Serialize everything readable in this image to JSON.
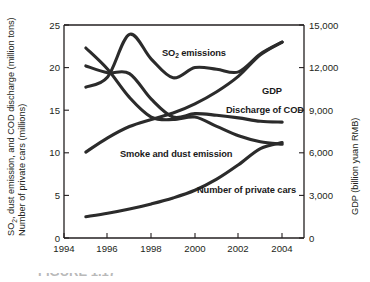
{
  "figure": {
    "caption_partial": "FIGURE 1.17"
  },
  "chart_data": {
    "type": "line",
    "title": "",
    "xlabel": "",
    "ylabel": "SO2, dust emission, and COD discharge (million tons) Number of private cars (millions)",
    "ylabel_line1": "SO",
    "ylabel_line1_sub": "2",
    "ylabel_line1_rest": ", dust emission, and COD discharge (million tons)",
    "ylabel_line2": "Number of private cars (millions)",
    "y2label": "GDP (billion yuan RMB)",
    "xlim": [
      1994,
      2005
    ],
    "ylim": [
      0,
      25
    ],
    "y2lim": [
      0,
      15000
    ],
    "grid": false,
    "legend_position": "inline-annotations",
    "xticks": [
      1994,
      1996,
      1998,
      2000,
      2002,
      2004
    ],
    "xtick_labels": [
      "1994",
      "1996",
      "1998",
      "2000",
      "2002",
      "2004"
    ],
    "yticks": [
      0,
      5,
      10,
      15,
      20,
      25
    ],
    "ytick_labels": [
      "0",
      "5",
      "10",
      "15",
      "20",
      "25"
    ],
    "y2ticks": [
      0,
      3000,
      6000,
      9000,
      12000,
      15000
    ],
    "y2tick_labels": [
      "0",
      "3,000",
      "6,000",
      "9,000",
      "12,000",
      "15,000"
    ],
    "x": [
      1995,
      1996,
      1997,
      1998,
      1999,
      2000,
      2001,
      2002,
      2003,
      2004
    ],
    "series": [
      {
        "name": "SO2 emissions",
        "label": "SO2 emissions",
        "label_main": "SO",
        "label_sub": "2",
        "label_rest": " emissions",
        "axis": "left",
        "units": "million tons",
        "values": [
          17.7,
          18.9,
          23.9,
          21.0,
          18.8,
          20.0,
          19.8,
          19.5,
          21.6,
          23.0
        ]
      },
      {
        "name": "Smoke and dust emission",
        "label": "Smoke and dust emission",
        "axis": "left",
        "units": "million tons",
        "values": [
          22.3,
          19.8,
          16.5,
          14.2,
          13.9,
          14.2,
          13.1,
          12.0,
          11.3,
          11.0
        ]
      },
      {
        "name": "Discharge of COD",
        "label": "Discharge of COD",
        "axis": "left",
        "units": "million tons",
        "values": [
          20.2,
          19.4,
          19.3,
          16.3,
          14.2,
          14.6,
          14.4,
          14.1,
          13.7,
          13.6
        ]
      },
      {
        "name": "Number of private cars",
        "label": "Number of private cars",
        "axis": "left",
        "units": "millions",
        "values": [
          2.5,
          2.9,
          3.4,
          4.0,
          4.7,
          5.6,
          6.9,
          8.6,
          10.5,
          11.2
        ]
      },
      {
        "name": "GDP",
        "label": "GDP",
        "axis": "right",
        "units": "billion yuan RMB",
        "values": [
          6050,
          7050,
          7850,
          8350,
          8800,
          9450,
          10300,
          11400,
          12900,
          13800
        ]
      }
    ],
    "annotations": [
      {
        "text": "SO2 emissions",
        "x": 1998.7,
        "y": 21.9
      },
      {
        "text": "GDP",
        "x": 2002.6,
        "y": 17.8
      },
      {
        "text": "Discharge of COD",
        "x": 2001.6,
        "y": 15.6
      },
      {
        "text": "Smoke and dust emission",
        "x": 1997.2,
        "y": 9.8
      },
      {
        "text": "Number of private cars",
        "x": 2000.1,
        "y": 4.9
      }
    ]
  }
}
